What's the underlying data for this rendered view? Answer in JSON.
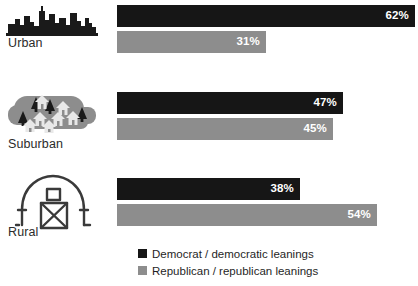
{
  "chart_data": {
    "type": "bar",
    "orientation": "horizontal",
    "title": "",
    "subtitle": "",
    "xlabel": "",
    "ylabel": "",
    "xlim": [
      0,
      62
    ],
    "grid": false,
    "legend_position": "bottom",
    "categories": [
      "Urban",
      "Suburban",
      "Rural"
    ],
    "series": [
      {
        "name": "Democrat / democratic leanings",
        "color": "#161616",
        "values": [
          62,
          47,
          38
        ],
        "labels": [
          "62%",
          "47%",
          "38%"
        ]
      },
      {
        "name": "Republican / republican leanings",
        "color": "#8d8d8d",
        "values": [
          31,
          45,
          54
        ],
        "labels": [
          "31%",
          "45%",
          "54%"
        ]
      }
    ]
  },
  "categories": [
    {
      "key": "urban",
      "label": "Urban",
      "icon": "city-skyline-icon",
      "dem_value": "62%",
      "rep_value": "31%",
      "dem_width": 298,
      "rep_width": 149
    },
    {
      "key": "suburban",
      "label": "Suburban",
      "icon": "suburban-houses-icon",
      "dem_value": "47%",
      "rep_value": "45%",
      "dem_width": 226,
      "rep_width": 216
    },
    {
      "key": "rural",
      "label": "Rural",
      "icon": "barn-icon",
      "dem_value": "38%",
      "rep_value": "54%",
      "dem_width": 183,
      "rep_width": 260
    }
  ],
  "legend": {
    "items": [
      {
        "label": "Democrat / democratic leanings",
        "color": "#161616"
      },
      {
        "label": "Republican / republican leanings",
        "color": "#8d8d8d"
      }
    ]
  },
  "colors": {
    "democrat": "#161616",
    "republican": "#8d8d8d",
    "background": "#ffffff",
    "text": "#1f1f1f",
    "icon_outline": "#3a3a3a",
    "icon_fill_gray": "#8d8d8d"
  }
}
